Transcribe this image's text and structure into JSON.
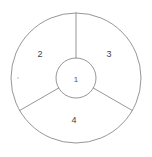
{
  "diagram": {
    "background_color": "#ffffff",
    "stroke_color": "#8a8a8a",
    "label_color": "#444444",
    "geometry": {
      "center_x": 76,
      "center_y": 78,
      "outer_radius": 65,
      "inner_radius": 20,
      "spoke_angles_deg": [
        90,
        210,
        330
      ]
    },
    "hub": {
      "label": "1",
      "label_x": 76,
      "label_y": 80
    },
    "sectors": [
      {
        "id": "sector-2",
        "label": "2",
        "label_x": 40,
        "label_y": 55,
        "start_angle_deg": 90,
        "end_angle_deg": 210
      },
      {
        "id": "sector-3",
        "label": "3",
        "label_x": 109,
        "label_y": 55,
        "start_angle_deg": 330,
        "end_angle_deg": 90
      },
      {
        "id": "sector-4",
        "label": "4",
        "label_x": 74,
        "label_y": 121,
        "start_angle_deg": 210,
        "end_angle_deg": 330
      }
    ]
  }
}
